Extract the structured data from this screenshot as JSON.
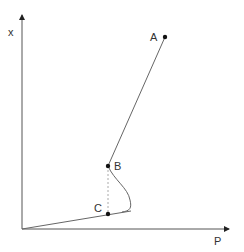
{
  "diagram": {
    "axes": {
      "x_label": "P",
      "y_label": "x"
    },
    "points": [
      {
        "id": "A",
        "label": "A"
      },
      {
        "id": "B",
        "label": "B"
      },
      {
        "id": "C",
        "label": "C"
      }
    ],
    "colors": {
      "axis": "#555555",
      "curve": "#777777",
      "dashed": "#aaaaaa",
      "point": "#111111",
      "text": "#333333"
    }
  }
}
